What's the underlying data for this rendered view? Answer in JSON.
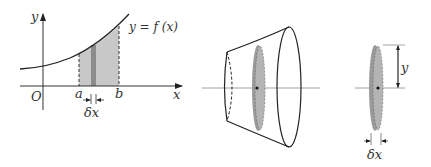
{
  "diagram": {
    "panel1": {
      "axis_y_label": "y",
      "axis_x_label": "x",
      "origin_label": "O",
      "curve_label": "y = f (x)",
      "a_label": "a",
      "b_label": "b",
      "width_label": "δx"
    },
    "panel2": {
      "description": "Solid of revolution with a shaded disc slice"
    },
    "panel3": {
      "radius_label": "y",
      "width_label": "δx"
    },
    "colors": {
      "region_fill": "#c8c8c8",
      "strip_fill": "#8c8c8c",
      "disc_fill": "#9a9a9a",
      "line": "#222222"
    }
  }
}
